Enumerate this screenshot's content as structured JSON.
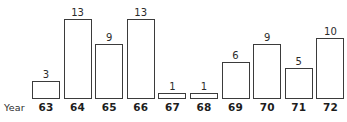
{
  "chart_data": {
    "type": "bar",
    "title": "",
    "subtitle": "",
    "xlabel": "Year",
    "ylabel": "",
    "categories": [
      "63",
      "64",
      "65",
      "66",
      "67",
      "68",
      "69",
      "70",
      "71",
      "72"
    ],
    "values": [
      3,
      13,
      9,
      13,
      1,
      1,
      6,
      9,
      5,
      10
    ],
    "data_labels": [
      "3",
      "13",
      "9",
      "13",
      "1",
      "1",
      "6",
      "9",
      "5",
      "10"
    ],
    "ylim": [
      0,
      13
    ],
    "grid": false,
    "legend": null,
    "legend_position": "none",
    "axis_line_visible": false,
    "y_axis_visible": false,
    "y_tick_labels": [],
    "annotations": [],
    "style": {
      "bar_fill": "#ffffff",
      "bar_stroke": "#3b3b3b",
      "background": "#ffffff",
      "label_color": "#2b2b2b",
      "tick_color": "#1d1d1d"
    }
  },
  "axis": {
    "x_title": "Year"
  }
}
